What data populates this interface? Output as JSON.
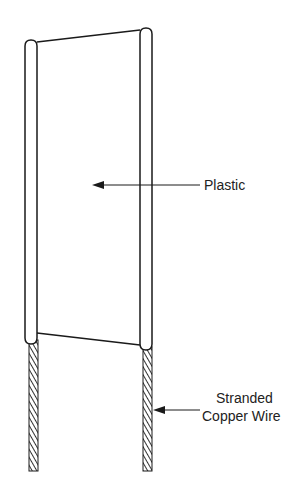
{
  "diagram": {
    "type": "technical-illustration",
    "labels": {
      "plastic": "Plastic",
      "copper_line1": "Stranded",
      "copper_line2": "Copper Wire"
    },
    "colors": {
      "line": "#1a1a1a",
      "background": "#ffffff",
      "wire_hatch": "#333333"
    }
  }
}
